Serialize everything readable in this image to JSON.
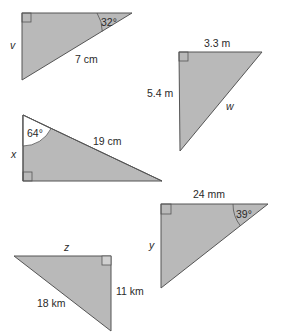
{
  "colors": {
    "fill": "#b9b9b9",
    "stroke": "#555555",
    "arc_fill": "#ffffff",
    "text": "#2a2a2a"
  },
  "triangles": [
    {
      "id": "t1",
      "points": "22,13 132,13 22,80",
      "right_angle_at": "top-left",
      "labels": {
        "hypotenuse": "7 cm",
        "vertical_side": "v",
        "angle": "32°"
      }
    },
    {
      "id": "t2",
      "points": "179,52 262,52 180,151",
      "right_angle_at": "top-left",
      "labels": {
        "top_side": "3.3 m",
        "vertical_side": "5.4 m",
        "hypotenuse": "w"
      }
    },
    {
      "id": "t3",
      "points": "23,115 23,181 162,181",
      "right_angle_at": "bottom-left",
      "labels": {
        "hypotenuse": "19 cm",
        "vertical_side": "x",
        "angle": "64°"
      }
    },
    {
      "id": "t4",
      "points": "161,204 268,204 161,288",
      "right_angle_at": "top-left",
      "labels": {
        "top_side": "24 mm",
        "vertical_side": "y",
        "angle": "39°"
      }
    },
    {
      "id": "t5",
      "points": "14,256 111,256 111,331",
      "right_angle_at": "top-right",
      "labels": {
        "top_side": "z",
        "vertical_side": "11 km",
        "hypotenuse": "18 km"
      }
    }
  ]
}
